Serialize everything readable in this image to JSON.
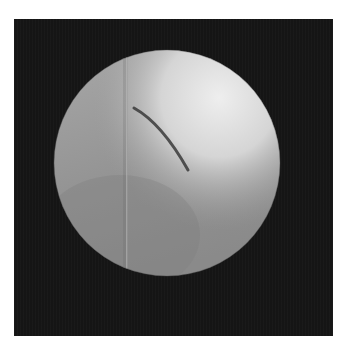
{
  "image": {
    "description": "Fluoroscopic X-ray image showing a circular field of view on a black background with a curved catheter/guidewire shadow",
    "background_color": "#151515",
    "frame": {
      "x": 14,
      "y": 19,
      "width": 319,
      "height": 317
    },
    "field_of_view": {
      "cx": 167,
      "cy": 163,
      "r": 113
    },
    "colors": {
      "bright_region": "#e6e6e6",
      "mid_gray": "#9a9a9a",
      "dark_gray": "#7a7a7a",
      "catheter": "#3a3a3a"
    }
  }
}
